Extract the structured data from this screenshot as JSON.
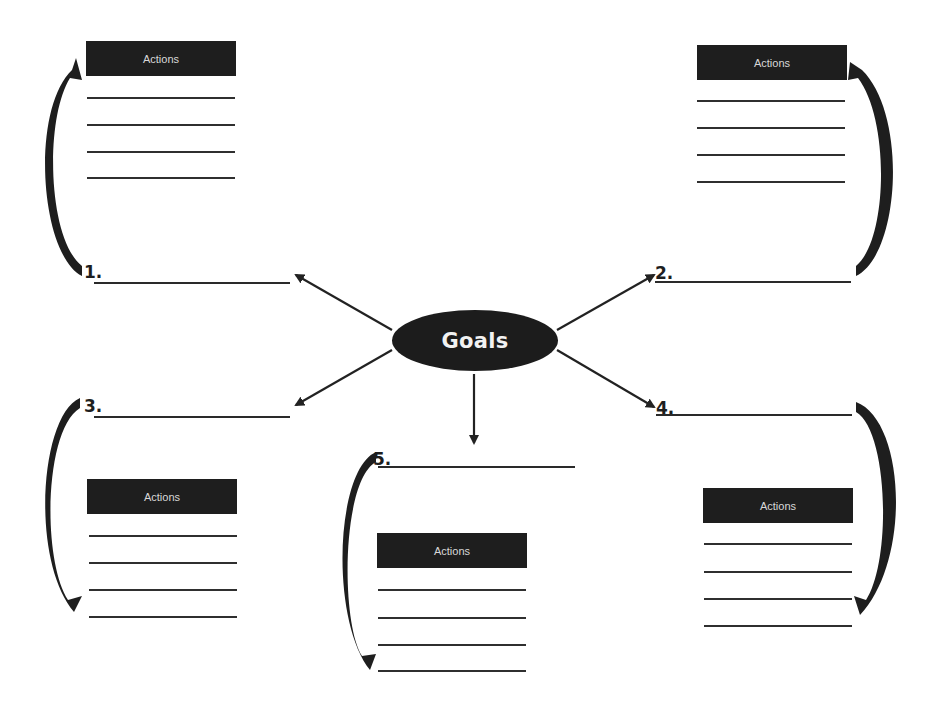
{
  "center": {
    "label": "Goals",
    "color": "#1c1c1c",
    "text_color": "#f2f2f2"
  },
  "goals": [
    {
      "number": "1.",
      "blank_line": ""
    },
    {
      "number": "2.",
      "blank_line": ""
    },
    {
      "number": "3.",
      "blank_line": ""
    },
    {
      "number": "4.",
      "blank_line": ""
    },
    {
      "number": "5.",
      "blank_line": ""
    }
  ],
  "action_boxes": [
    {
      "header": "Actions",
      "lines": [
        "",
        "",
        "",
        ""
      ]
    },
    {
      "header": "Actions",
      "lines": [
        "",
        "",
        "",
        ""
      ]
    },
    {
      "header": "Actions",
      "lines": [
        "",
        "",
        "",
        ""
      ]
    },
    {
      "header": "Actions",
      "lines": [
        "",
        "",
        "",
        ""
      ]
    },
    {
      "header": "Actions",
      "lines": [
        "",
        "",
        "",
        ""
      ]
    }
  ]
}
